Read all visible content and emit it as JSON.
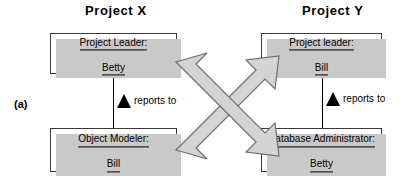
{
  "diagram": {
    "section_label": "(a)",
    "columns": [
      {
        "title": "Project X"
      },
      {
        "title": "Project Y"
      }
    ],
    "boxes": [
      {
        "role": "Project Leader:",
        "person": "Betty"
      },
      {
        "role": "Object Modeler:",
        "person": "Bill"
      },
      {
        "role": "Project leader:",
        "person": "Bill"
      },
      {
        "role": "Database Administrator:",
        "person": "Betty"
      }
    ],
    "relations": {
      "reports_to_left": "reports to",
      "reports_to_right": "reports to"
    },
    "colors": {
      "box_border": "#3a3a3a",
      "box_fill": "#ffffff",
      "shadow": "#c9c9c9",
      "arrow_fill": "#d4d4d4",
      "arrow_stroke": "#6e6e6e",
      "text": "#000000"
    },
    "icons": {
      "reports_to_marker": "solid-up-triangle",
      "cross_arrow_left_to_right_up": "block-arrow-up-right",
      "cross_arrow_left_to_right_down": "block-arrow-down-right"
    }
  }
}
